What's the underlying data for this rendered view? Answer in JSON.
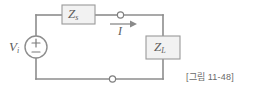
{
  "figure": {
    "caption": "[그림 11-48]",
    "type": "electrical-circuit-schematic"
  },
  "labels": {
    "source_voltage": {
      "symbol": "V",
      "subscript": "i"
    },
    "source_impedance": {
      "symbol": "Z",
      "subscript": "s"
    },
    "load_impedance": {
      "symbol": "Z",
      "subscript": "L"
    },
    "current": {
      "symbol": "I",
      "subscript": ""
    }
  },
  "components": [
    {
      "name": "voltage-source",
      "kind": "circle-source",
      "polarity_top": "+",
      "polarity_bottom": "−"
    },
    {
      "name": "source-impedance-box",
      "kind": "rect-impedance"
    },
    {
      "name": "load-impedance-box",
      "kind": "rect-impedance"
    },
    {
      "name": "terminal-top",
      "kind": "open-terminal"
    },
    {
      "name": "terminal-bottom",
      "kind": "open-terminal"
    },
    {
      "name": "current-arrow",
      "kind": "arrow",
      "direction": "right"
    }
  ],
  "colors": {
    "background": "#ffffff",
    "wire": "#8d8d8d",
    "box_fill": "#f2f2f2",
    "box_stroke": "#9a9a9a",
    "text": "#5d5d5d",
    "caption": "#6a6a6a"
  },
  "polarity": {
    "plus": "+",
    "minus": "−"
  }
}
